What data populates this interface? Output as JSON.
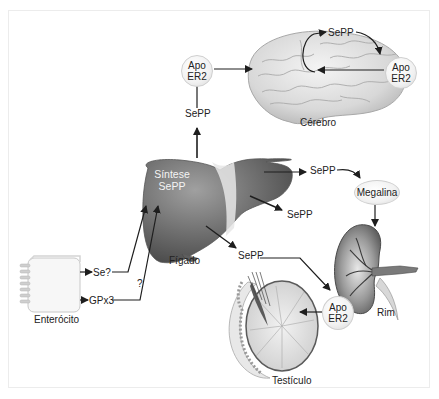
{
  "diagram": {
    "type": "selenoprotein-p-transport",
    "organs": {
      "brain": {
        "label": "Cérebro"
      },
      "liver": {
        "label": "Fígado",
        "inner_label_line1": "Síntese",
        "inner_label_line2": "SePP"
      },
      "kidney": {
        "label": "Rim"
      },
      "testis": {
        "label": "Testículo"
      },
      "enterocyte": {
        "label": "Enterócito"
      }
    },
    "receptors": {
      "brain_apoer2_left": {
        "line1": "Apo",
        "line2": "ER2"
      },
      "brain_apoer2_right": {
        "line1": "Apo",
        "line2": "ER2"
      },
      "testis_apoer2": {
        "line1": "Apo",
        "line2": "ER2"
      },
      "kidney_megalin": {
        "label": "Megalina"
      }
    },
    "labels": {
      "sepp_up": "SePP",
      "sepp_brain_cycle": "SePP",
      "sepp_kidney": "SePP",
      "sepp_middle": "SePP",
      "sepp_testis": "SePP",
      "se_question": "Se?",
      "gpx3": "GPx3",
      "question_mark": "?"
    },
    "colors": {
      "liver": "#6e6e6e",
      "liver_highlight": "#9a9a9a",
      "arrow": "#1e1e1e",
      "bubble": "#f1f1f1",
      "frame_border": "#ececec"
    }
  }
}
